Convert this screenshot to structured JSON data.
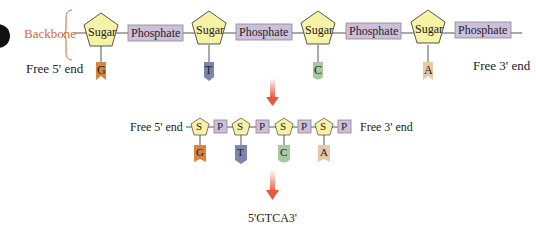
{
  "top": {
    "backbone_label": "Backbone",
    "free5_label": "Free 5' end",
    "free3_label": "Free 3' end",
    "sugar_label": "Sugar",
    "phosphate_label": "Phosphate",
    "bases": [
      "G",
      "T",
      "C",
      "A"
    ]
  },
  "middle": {
    "free5_label": "Free 5' end",
    "free3_label": "Free 3' end",
    "sugar_abbrev": "S",
    "phosphate_abbrev": "P",
    "bases": [
      "G",
      "T",
      "C",
      "A"
    ]
  },
  "bottom": {
    "sequence": "5'GTCA3'"
  },
  "colors": {
    "sugar_fill": "#f6f2a6",
    "phosphate_fill": "#cdbfdc",
    "backbone_label": "#d2693c",
    "arrow": "#e8593a",
    "base_G": "#d9833f",
    "base_T": "#7c86a8",
    "base_C": "#a8c9a2",
    "base_A": "#e6c7a6"
  }
}
